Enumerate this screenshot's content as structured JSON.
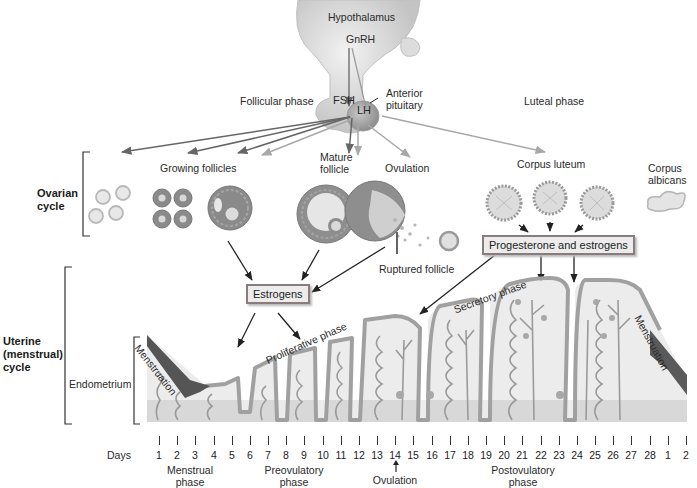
{
  "hormones": {
    "hypothalamus": "Hypothalamus",
    "gnrh": "GnRH",
    "fsh": "FSH",
    "lh": "LH",
    "anterior_pituitary_line1": "Anterior",
    "anterior_pituitary_line2": "pituitary"
  },
  "phases_top": {
    "follicular": "Follicular phase",
    "luteal": "Luteal phase"
  },
  "ovarian": {
    "label_line1": "Ovarian",
    "label_line2": "cycle",
    "growing_follicles": "Growing follicles",
    "mature_follicle_line1": "Mature",
    "mature_follicle_line2": "follicle",
    "ovulation": "Ovulation",
    "ruptured_follicle": "Ruptured follicle",
    "corpus_luteum": "Corpus luteum",
    "corpus_albicans_line1": "Corpus",
    "corpus_albicans_line2": "albicans"
  },
  "boxes": {
    "estrogens": "Estrogens",
    "progesterone_estrogens": "Progesterone and estrogens"
  },
  "uterine": {
    "label_line1": "Uterine",
    "label_line2": "(menstrual)",
    "label_line3": "cycle",
    "endometrium": "Endometrium",
    "menstruation_left": "Menstruation",
    "menstruation_right": "Menstruation",
    "proliferative_phase": "Proliferative phase",
    "secretory_phase": "Secretory phase"
  },
  "timeline": {
    "days_label": "Days",
    "days": [
      "1",
      "2",
      "3",
      "4",
      "5",
      "6",
      "7",
      "8",
      "9",
      "10",
      "11",
      "12",
      "13",
      "14",
      "15",
      "16",
      "17",
      "18",
      "19",
      "20",
      "21",
      "22",
      "23",
      "24",
      "25",
      "26",
      "27",
      "28",
      "1",
      "2"
    ],
    "menstrual_phase_line1": "Menstrual",
    "menstrual_phase_line2": "phase",
    "preovulatory_phase_line1": "Preovulatory",
    "preovulatory_phase_line2": "phase",
    "ovulation": "Ovulation",
    "postovulatory_phase_line1": "Postovulatory",
    "postovulatory_phase_line2": "phase"
  },
  "colors": {
    "fsh_arrow": "#666666",
    "lh_arrow": "#a8a8a8",
    "lining": "#a0a0a0",
    "tissue": "#ececec",
    "basal_layer": "#d8d8d8",
    "menstrual_flow": "#555555"
  }
}
